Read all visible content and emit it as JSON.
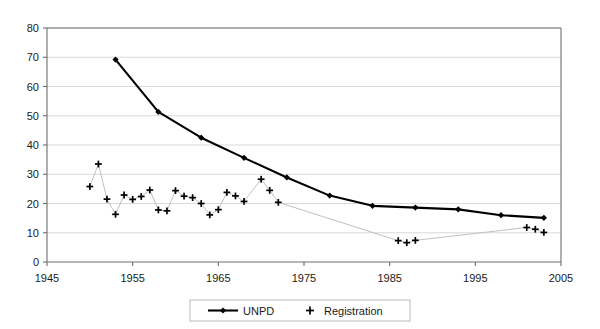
{
  "chart_data": {
    "type": "line",
    "title": "",
    "subtitle": "",
    "xlabel": "",
    "ylabel": "",
    "xlim": [
      1945,
      2005
    ],
    "ylim": [
      0,
      80
    ],
    "xticks": [
      1945,
      1955,
      1965,
      1975,
      1985,
      1995,
      2005
    ],
    "yticks": [
      0,
      10,
      20,
      30,
      40,
      50,
      60,
      70,
      80
    ],
    "grid": "horizontal",
    "legend_position": "bottom",
    "series": [
      {
        "name": "UNPD",
        "marker": "filled-diamond",
        "color": "#000000",
        "points": [
          [
            1953,
            69.2
          ],
          [
            1958,
            51.3
          ],
          [
            1963,
            42.5
          ],
          [
            1968,
            35.6
          ],
          [
            1973,
            28.9
          ],
          [
            1978,
            22.7
          ],
          [
            1983,
            19.2
          ],
          [
            1988,
            18.6
          ],
          [
            1993,
            18.0
          ],
          [
            1998,
            16.0
          ],
          [
            2003,
            15.1
          ]
        ]
      },
      {
        "name": "Registration",
        "marker": "plus",
        "color": "#000000",
        "points": [
          [
            1950,
            25.8
          ],
          [
            1951,
            33.5
          ],
          [
            1952,
            21.5
          ],
          [
            1953,
            16.3
          ],
          [
            1954,
            22.9
          ],
          [
            1955,
            21.4
          ],
          [
            1956,
            22.4
          ],
          [
            1957,
            24.6
          ],
          [
            1958,
            17.8
          ],
          [
            1959,
            17.5
          ],
          [
            1960,
            24.4
          ],
          [
            1961,
            22.5
          ],
          [
            1962,
            22.0
          ],
          [
            1963,
            20.0
          ],
          [
            1964,
            16.1
          ],
          [
            1965,
            17.9
          ],
          [
            1966,
            23.8
          ],
          [
            1967,
            22.6
          ],
          [
            1968,
            20.7
          ],
          [
            1970,
            28.3
          ],
          [
            1971,
            24.5
          ],
          [
            1972,
            20.4
          ],
          [
            1986,
            7.3
          ],
          [
            1987,
            6.6
          ],
          [
            1988,
            7.4
          ],
          [
            2001,
            11.8
          ],
          [
            2002,
            11.2
          ],
          [
            2003,
            10.1
          ]
        ]
      }
    ]
  },
  "legend": {
    "items": [
      {
        "label": "UNPD",
        "marker": "line-with-diamond"
      },
      {
        "label": "Registration",
        "marker": "plus"
      }
    ]
  },
  "axes": {
    "y_tick_labels": [
      "0",
      "10",
      "20",
      "30",
      "40",
      "50",
      "60",
      "70",
      "80"
    ],
    "x_tick_labels": [
      "1945",
      "1955",
      "1965",
      "1975",
      "1985",
      "1995",
      "2005"
    ]
  }
}
